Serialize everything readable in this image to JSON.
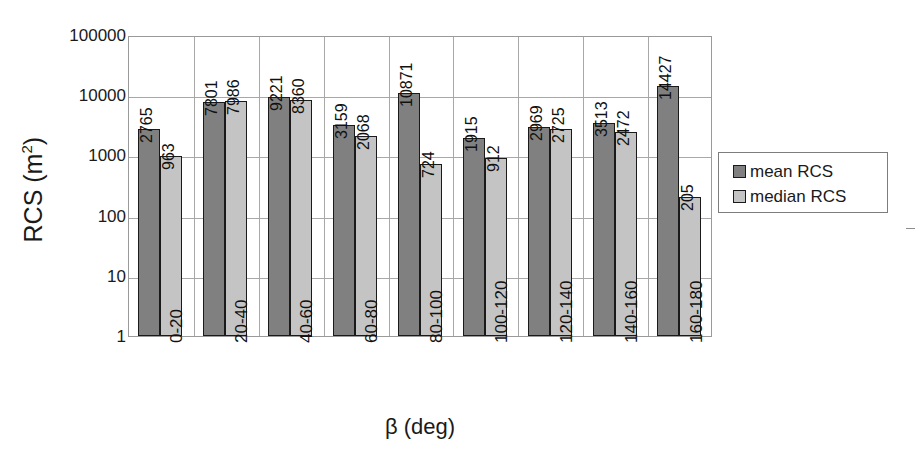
{
  "chart_data": {
    "type": "bar",
    "title": "",
    "xlabel": "β (deg)",
    "ylabel": "RCS (m²)",
    "ylabel_base": "RCS (m",
    "ylabel_sup": "2",
    "ylabel_close": ")",
    "yscale": "log",
    "ylim": [
      1,
      100000
    ],
    "ytick_labels": [
      "100000",
      "10000",
      "1000",
      "100",
      "10",
      "1"
    ],
    "ytick_values": [
      100000,
      10000,
      1000,
      100,
      10,
      1
    ],
    "grid": "horizontal-and-vertical",
    "legend_position": "right",
    "categories": [
      "0-20",
      "20-40",
      "40-60",
      "60-80",
      "80-100",
      "100-120",
      "120-140",
      "140-160",
      "160-180"
    ],
    "series": [
      {
        "name": "mean RCS",
        "color": "#808080",
        "values": [
          2765,
          7801,
          9221,
          3159,
          10871,
          1915,
          2969,
          3513,
          14427
        ],
        "labels": [
          "2765",
          "7801",
          "9221",
          "3159",
          "10871",
          "1915",
          "2969",
          "3513",
          "14427"
        ]
      },
      {
        "name": "median RCS",
        "color": "#c4c4c4",
        "values": [
          963,
          7986,
          8360,
          2068,
          724,
          912,
          2725,
          2472,
          205
        ],
        "labels": [
          "963",
          "7986",
          "8360",
          "2068",
          "724",
          "912",
          "2725",
          "2472",
          "205"
        ]
      }
    ]
  },
  "legend": {
    "items": [
      {
        "label": "mean RCS",
        "color": "#808080"
      },
      {
        "label": "median RCS",
        "color": "#c4c4c4"
      }
    ]
  }
}
